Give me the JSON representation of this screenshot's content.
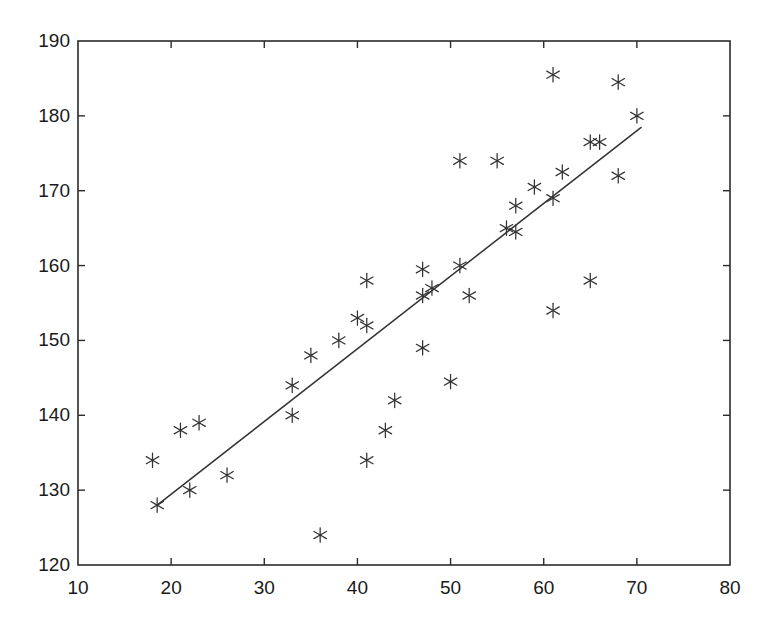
{
  "chart_data": {
    "type": "scatter",
    "title": "",
    "xlabel": "",
    "ylabel": "",
    "xlim": [
      10,
      80
    ],
    "ylim": [
      120,
      190
    ],
    "xticks": [
      10,
      20,
      30,
      40,
      50,
      60,
      70,
      80
    ],
    "yticks": [
      120,
      130,
      140,
      150,
      160,
      170,
      180,
      190
    ],
    "xtick_labels": [
      "10",
      "20",
      "30",
      "40",
      "50",
      "60",
      "70",
      "80"
    ],
    "ytick_labels": [
      "120",
      "130",
      "140",
      "150",
      "160",
      "170",
      "180",
      "190"
    ],
    "grid": false,
    "legend": null,
    "marker": "asterisk",
    "marker_color": "#333333",
    "line_color": "#333333",
    "box_border": true,
    "series": [
      {
        "name": "observations",
        "marker": "*",
        "points": [
          [
            18.0,
            134.0
          ],
          [
            18.5,
            128.0
          ],
          [
            21.0,
            138.0
          ],
          [
            22.0,
            130.0
          ],
          [
            23.0,
            139.0
          ],
          [
            26.0,
            132.0
          ],
          [
            33.0,
            140.0
          ],
          [
            33.0,
            144.0
          ],
          [
            35.0,
            148.0
          ],
          [
            36.0,
            124.0
          ],
          [
            38.0,
            150.0
          ],
          [
            40.0,
            153.0
          ],
          [
            41.0,
            152.0
          ],
          [
            41.0,
            158.0
          ],
          [
            41.0,
            134.0
          ],
          [
            43.0,
            138.0
          ],
          [
            44.0,
            142.0
          ],
          [
            47.0,
            149.0
          ],
          [
            47.0,
            156.0
          ],
          [
            47.0,
            159.5
          ],
          [
            48.0,
            157.0
          ],
          [
            50.0,
            144.5
          ],
          [
            51.0,
            160.0
          ],
          [
            51.0,
            174.0
          ],
          [
            52.0,
            156.0
          ],
          [
            55.0,
            174.0
          ],
          [
            56.0,
            165.0
          ],
          [
            57.0,
            164.5
          ],
          [
            57.0,
            168.0
          ],
          [
            59.0,
            170.5
          ],
          [
            61.0,
            169.0
          ],
          [
            61.0,
            154.0
          ],
          [
            61.0,
            185.5
          ],
          [
            62.0,
            172.5
          ],
          [
            65.0,
            158.0
          ],
          [
            65.0,
            176.5
          ],
          [
            66.0,
            176.5
          ],
          [
            68.0,
            172.0
          ],
          [
            68.0,
            184.5
          ],
          [
            70.0,
            180.0
          ]
        ]
      }
    ],
    "fit_line": {
      "name": "regression-line",
      "x_start": 18.5,
      "y_start": 128.0,
      "x_end": 70.5,
      "y_end": 178.5
    }
  }
}
